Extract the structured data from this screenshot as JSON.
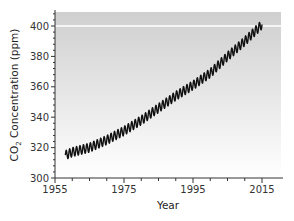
{
  "chart_data": {
    "type": "line",
    "title": "",
    "xlabel": "Year",
    "ylabel": "CO2 Concentration (ppm)",
    "ylabel_parts": {
      "pre": "CO",
      "sub": "2",
      "post": " Concentration (ppm)"
    },
    "xlim": [
      1955,
      2018
    ],
    "ylim": [
      300,
      410
    ],
    "xticks": [
      1955,
      1975,
      1995,
      2015
    ],
    "yticks": [
      300,
      320,
      340,
      360,
      380,
      400
    ],
    "grid": false,
    "legend": null,
    "reference_line": {
      "y": 400,
      "color": "#ffffff"
    },
    "background_gradient": {
      "top": "#cfcfcf",
      "bottom": "#ffffff"
    },
    "series": [
      {
        "name": "Mauna Loa CO2 (monthly, seasonal cycle)",
        "color": "#111111",
        "seasonal_amplitude_ppm": 3,
        "x": [
          1958,
          1960,
          1965,
          1970,
          1975,
          1980,
          1985,
          1990,
          1995,
          2000,
          2005,
          2010,
          2015
        ],
        "values": [
          315,
          317,
          320,
          325,
          331,
          338,
          346,
          354,
          361,
          369,
          380,
          390,
          401
        ]
      }
    ]
  }
}
